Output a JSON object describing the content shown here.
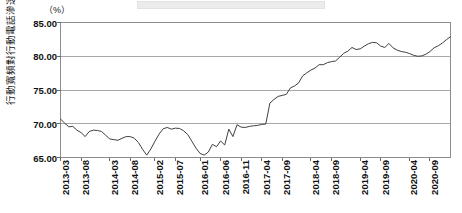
{
  "figure": {
    "unit_label": "（%）",
    "y_axis_title": "行動寬頻對行動電話滲透率",
    "top_banner": ""
  },
  "chart_data": {
    "type": "line",
    "title": "",
    "subtitle": "",
    "xlabel": "",
    "ylabel": "行動寬頻對行動電話滲透率",
    "unit": "%",
    "ylim": [
      65.0,
      85.0
    ],
    "yticks": [
      65.0,
      70.0,
      75.0,
      80.0,
      85.0
    ],
    "ytick_labels": [
      "65.00",
      "70.00",
      "75.00",
      "80.00",
      "85.00"
    ],
    "grid": true,
    "grid_axis": "y",
    "legend": false,
    "legend_position": "none",
    "line_color": "#3f3f3f",
    "line_width": 1,
    "marker": "none",
    "xtick_labels": [
      "2013-03",
      "2013-08",
      "2014-03",
      "2014-08",
      "2015-02",
      "2015-07",
      "2016-01",
      "2016-06",
      "2016-11",
      "2017-04",
      "2017-09",
      "2018-04",
      "2018-09",
      "2019-04",
      "2019-09",
      "2020-04",
      "2020-09"
    ],
    "xtick_indices": [
      0,
      5,
      12,
      17,
      23,
      28,
      34,
      39,
      44,
      49,
      54,
      61,
      66,
      73,
      78,
      85,
      90
    ],
    "x": [
      "2013-03",
      "2013-04",
      "2013-05",
      "2013-06",
      "2013-07",
      "2013-08",
      "2013-09",
      "2013-10",
      "2013-11",
      "2013-12",
      "2014-01",
      "2014-02",
      "2014-03",
      "2014-04",
      "2014-05",
      "2014-06",
      "2014-07",
      "2014-08",
      "2014-09",
      "2014-10",
      "2014-11",
      "2014-12",
      "2015-01",
      "2015-02",
      "2015-03",
      "2015-04",
      "2015-05",
      "2015-06",
      "2015-07",
      "2015-08",
      "2015-09",
      "2015-10",
      "2015-11",
      "2015-12",
      "2016-01",
      "2016-02",
      "2016-03",
      "2016-04",
      "2016-05",
      "2016-06",
      "2016-07",
      "2016-08",
      "2016-09",
      "2016-10",
      "2016-11",
      "2016-12",
      "2017-01",
      "2017-02",
      "2017-03",
      "2017-04",
      "2017-05",
      "2017-06",
      "2017-07",
      "2017-08",
      "2017-09",
      "2017-10",
      "2017-11",
      "2017-12",
      "2018-01",
      "2018-02",
      "2018-03",
      "2018-04",
      "2018-05",
      "2018-06",
      "2018-07",
      "2018-08",
      "2018-09",
      "2018-10",
      "2018-11",
      "2018-12",
      "2019-01",
      "2019-02",
      "2019-03",
      "2019-04",
      "2019-05",
      "2019-06",
      "2019-07",
      "2019-08",
      "2019-09",
      "2019-10",
      "2019-11",
      "2019-12",
      "2020-01",
      "2020-02",
      "2020-03",
      "2020-04",
      "2020-05",
      "2020-06",
      "2020-07",
      "2020-08",
      "2020-09",
      "2020-10"
    ],
    "values": [
      70.7,
      70.1,
      69.55,
      69.6,
      69.05,
      68.7,
      68.1,
      68.85,
      69.05,
      69.0,
      68.85,
      68.3,
      67.75,
      67.65,
      67.55,
      67.85,
      68.1,
      68.1,
      67.85,
      67.2,
      66.2,
      65.35,
      66.25,
      67.4,
      68.45,
      69.25,
      69.45,
      69.2,
      69.35,
      69.3,
      68.95,
      68.4,
      67.4,
      66.4,
      65.6,
      65.35,
      65.8,
      66.95,
      66.6,
      67.45,
      66.85,
      69.2,
      68.1,
      69.85,
      69.5,
      69.45,
      69.6,
      69.7,
      69.75,
      69.9,
      69.95,
      73.05,
      73.6,
      74.05,
      74.2,
      74.35,
      75.3,
      75.6,
      76.05,
      77.1,
      77.55,
      77.95,
      78.25,
      78.75,
      78.75,
      79.05,
      79.2,
      79.3,
      79.85,
      80.45,
      80.75,
      81.3,
      81.0,
      81.1,
      81.5,
      81.85,
      82.05,
      82.0,
      81.5,
      81.3,
      81.9,
      81.25,
      80.9,
      80.7,
      80.6,
      80.4,
      80.15,
      80.0,
      80.05,
      80.3,
      80.7,
      81.25
    ],
    "values_extended_note": "monthly series 2013-03 .. 2020-12",
    "x_tail": [
      "2020-11",
      "2020-12",
      "2021-01",
      "2021-02"
    ],
    "values_tail": [
      81.55,
      81.95,
      82.45,
      82.9
    ]
  }
}
